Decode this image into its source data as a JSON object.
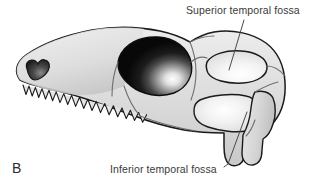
{
  "figure": {
    "panel_letter": "B",
    "background_color": "#ffffff",
    "width": 313,
    "height": 185
  },
  "labels": {
    "superior": {
      "text": "Superior temporal fossa",
      "color": "#3a3a3a"
    },
    "inferior": {
      "text": "Inferior temporal fossa",
      "color": "#3a3a3a"
    }
  },
  "colors": {
    "outline": "#1a1a1a",
    "suture": "#6b6b6b",
    "bone_light": "#e6e6e6",
    "bone_mid": "#d2d2d2",
    "bone_shadow": "#b8b8b8",
    "orbit_dark": "#121212",
    "orbit_highlight": "#ffffff",
    "naris_dark": "#2a2a2a",
    "fossa_light": "#fdfdfd",
    "leader_line": "#4a4a4a",
    "text": "#3a3a3a"
  },
  "anatomy": {
    "orbit": "eye-socket",
    "naris": "external-naris",
    "superior_temporal_fossa": "upper-temporal-opening",
    "inferior_temporal_fossa": "lower-temporal-opening",
    "quadrate": "posterior-jaw-strut",
    "tooth_count": 16
  }
}
